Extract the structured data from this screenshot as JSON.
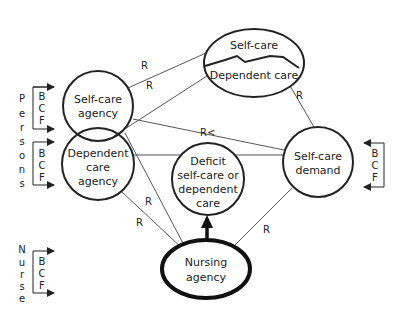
{
  "diagram": {
    "nodes": {
      "self_care_agency": {
        "line1": "Self-care",
        "line2": "agency"
      },
      "dependent_care_agency": {
        "line1": "Dependent",
        "line2": "care",
        "line3": "agency"
      },
      "self_care_top": {
        "upper": "Self-care",
        "lower": "Dependent care"
      },
      "deficit": {
        "line1": "Deficit",
        "line2": "self-care or",
        "line3": "dependent",
        "line4": "care"
      },
      "self_care_demand": {
        "line1": "Self-care",
        "line2": "demand"
      },
      "nursing_agency": {
        "line1": "Nursing",
        "line2": "agency"
      }
    },
    "relations": {
      "r1": "R",
      "r2": "R",
      "r3": "R",
      "r_less": "R<",
      "r4": "R",
      "r5": "R",
      "r6": "R"
    },
    "side_labels": {
      "persons": [
        "P",
        "e",
        "r",
        "s",
        "o",
        "n",
        "s"
      ],
      "nurse": [
        "N",
        "u",
        "r",
        "s",
        "e"
      ]
    },
    "bcf": {
      "persons_top": [
        "B",
        "C",
        "F"
      ],
      "persons_bottom": [
        "B",
        "C",
        "F"
      ],
      "demand": [
        "B",
        "C",
        "F"
      ],
      "nurse": [
        "B",
        "C",
        "F"
      ]
    }
  }
}
